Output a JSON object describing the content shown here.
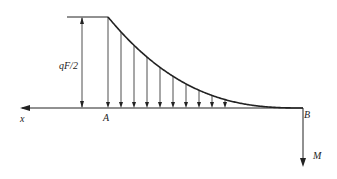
{
  "diagram": {
    "labels": {
      "x_axis": "x",
      "point_a": "A",
      "point_b": "B",
      "moment": "M",
      "magnitude": "qF/2"
    },
    "load": {
      "type": "distributed-decreasing",
      "arrow_count": 10
    },
    "colors": {
      "line": "#222222"
    }
  }
}
